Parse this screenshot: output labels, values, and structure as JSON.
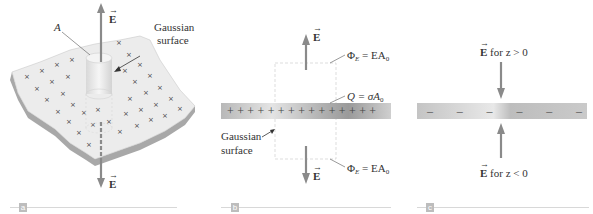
{
  "panels": {
    "a": {
      "tag": "a",
      "label_area": "A",
      "label_gaussian_1": "Gaussian",
      "label_gaussian_2": "surface",
      "field_top": "E",
      "field_bottom": "E",
      "charge_symbol": "×"
    },
    "b": {
      "tag": "b",
      "field_top": "E",
      "field_bottom": "E",
      "flux_top": "Φ",
      "flux_top_sub": "E",
      "flux_top_rhs": " = EA",
      "flux_top_rhs_sub": "0",
      "charge_lhs": "Q = σA",
      "charge_sub": "0",
      "flux_bottom": "Φ",
      "flux_bottom_sub": "E",
      "flux_bottom_rhs": " = EA",
      "flux_bottom_rhs_sub": "0",
      "label_gaussian_1": "Gaussian",
      "label_gaussian_2": "surface",
      "plus_signs": "+ + + + + + + + + + + + + + +"
    },
    "c": {
      "tag": "c",
      "field_top": "E",
      "field_top_cond": " for z > 0",
      "field_bottom": "E",
      "field_bottom_cond": " for z < 0",
      "minus_signs": [
        "–",
        "–",
        "–",
        "–",
        "–",
        "–"
      ]
    }
  },
  "colors": {
    "arrow": "#8a8a8a",
    "slab_light": "#e0e0e0",
    "slab_dark": "#9a9a9a",
    "sheet_top": "#eeeeee",
    "sheet_edge": "#a8a8a8"
  }
}
